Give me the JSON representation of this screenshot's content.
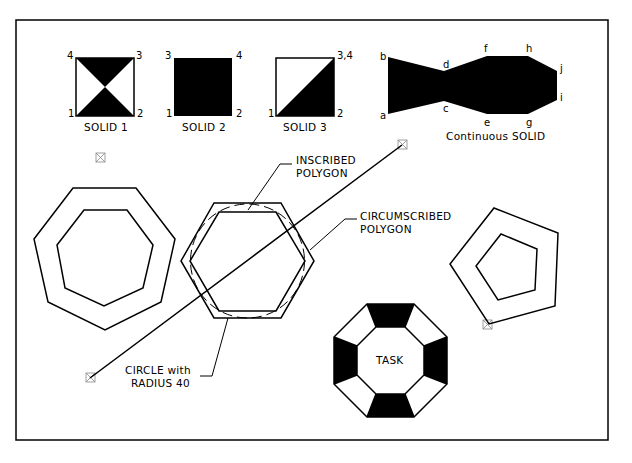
{
  "frame": {
    "stroke": "#000000",
    "background": "#ffffff"
  },
  "solids": [
    {
      "id": "solid1",
      "caption": "SOLID  1",
      "corners": {
        "bl": "1",
        "br": "2",
        "tr": "3",
        "tl": "4"
      }
    },
    {
      "id": "solid2",
      "caption": "SOLID  2",
      "corners": {
        "bl": "1",
        "br": "2",
        "tl": "3",
        "tr": "4"
      }
    },
    {
      "id": "solid3",
      "caption": "SOLID  3",
      "corners": {
        "bl": "1",
        "br": "2",
        "tr": "3,4"
      }
    }
  ],
  "continuous_solid": {
    "caption": "Continuous  SOLID",
    "points": [
      "a",
      "b",
      "c",
      "d",
      "e",
      "f",
      "g",
      "h",
      "i",
      "j"
    ]
  },
  "annotations": {
    "inscribed_line1": "INSCRIBED",
    "inscribed_line2": "POLYGON",
    "circumscribed_line1": "CIRCUMSCRIBED",
    "circumscribed_line2": "POLYGON",
    "circle_line1": "CIRCLE  with",
    "circle_line2": "RADIUS  40",
    "task": "TASK"
  },
  "markers": [
    "point-marker",
    "point-marker",
    "point-marker",
    "point-marker"
  ]
}
